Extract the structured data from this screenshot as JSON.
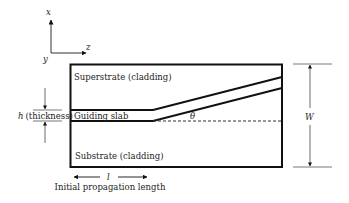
{
  "axes": {
    "x_label": "x",
    "y_label": "y",
    "z_label": "z"
  },
  "regions": {
    "superstrate": "Superstrate (cladding)",
    "guiding_slab": "Guiding slab",
    "substrate": "Substrate (cladding)"
  },
  "dimensions": {
    "thickness_symbol": "h",
    "thickness_text": "(thickness)",
    "width_symbol": "W",
    "angle_symbol": "θ",
    "length_symbol": "l",
    "length_caption": "Initial propagation length"
  },
  "colors": {
    "line": "#111111",
    "text": "#222222",
    "background": "#ffffff"
  }
}
